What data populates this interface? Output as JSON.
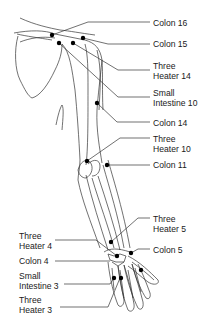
{
  "colors": {
    "line": "#333333",
    "point": "#000000",
    "text": "#1a1a1a"
  },
  "labels": [
    {
      "id": "colon-16",
      "lines": [
        "Colon 16"
      ],
      "x": 153,
      "y": 18
    },
    {
      "id": "colon-15",
      "lines": [
        "Colon 15"
      ],
      "x": 153,
      "y": 39
    },
    {
      "id": "three-heater-14",
      "lines": [
        "Three",
        "Heater 14"
      ],
      "x": 153,
      "y": 61
    },
    {
      "id": "small-intestine-10",
      "lines": [
        "Small",
        "Intestine 10"
      ],
      "x": 153,
      "y": 88
    },
    {
      "id": "colon-14",
      "lines": [
        "Colon 14"
      ],
      "x": 153,
      "y": 118
    },
    {
      "id": "three-heater-10",
      "lines": [
        "Three",
        "Heater 10"
      ],
      "x": 153,
      "y": 134
    },
    {
      "id": "colon-11",
      "lines": [
        "Colon 11"
      ],
      "x": 153,
      "y": 160
    },
    {
      "id": "three-heater-5",
      "lines": [
        "Three",
        "Heater 5"
      ],
      "x": 153,
      "y": 214
    },
    {
      "id": "colon-5",
      "lines": [
        "Colon 5"
      ],
      "x": 153,
      "y": 245
    },
    {
      "id": "three-heater-4",
      "lines": [
        "Three",
        "Heater 4"
      ],
      "x": 19,
      "y": 231
    },
    {
      "id": "colon-4",
      "lines": [
        "Colon 4"
      ],
      "x": 19,
      "y": 256
    },
    {
      "id": "small-intestine-3",
      "lines": [
        "Small",
        "Intestine 3"
      ],
      "x": 19,
      "y": 271
    },
    {
      "id": "three-heater-3",
      "lines": [
        "Three",
        "Heater 3"
      ],
      "x": 19,
      "y": 295
    }
  ]
}
